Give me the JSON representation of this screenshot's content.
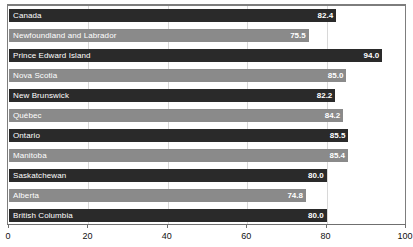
{
  "chart_data": {
    "type": "bar",
    "orientation": "horizontal",
    "title": "",
    "xlabel": "",
    "ylabel": "",
    "xlim": [
      0,
      100
    ],
    "grid": true,
    "legend": "none",
    "xticks": [
      "0",
      "20",
      "40",
      "60",
      "80",
      "100"
    ],
    "xtick_values": [
      0,
      20,
      40,
      60,
      80,
      100
    ],
    "categories": [
      "Canada",
      "Newfoundland and Labrador",
      "Prince Edward Island",
      "Nova Scotia",
      "New Brunswick",
      "Québec",
      "Ontario",
      "Manitoba",
      "Saskatchewan",
      "Alberta",
      "British Columbia"
    ],
    "values": [
      82.4,
      75.5,
      94.0,
      85.0,
      82.2,
      84.2,
      85.5,
      85.4,
      80.0,
      74.8,
      80.0
    ],
    "value_labels": [
      "82.4",
      "75.5",
      "94.0",
      "85.0",
      "82.2",
      "84.2",
      "85.5",
      "85.4",
      "80.0",
      "74.8",
      "80.0"
    ],
    "bar_colors": [
      "#2a2a2a",
      "#8a8a8a",
      "#2a2a2a",
      "#8a8a8a",
      "#2a2a2a",
      "#8a8a8a",
      "#2a2a2a",
      "#8a8a8a",
      "#2a2a2a",
      "#8a8a8a",
      "#2a2a2a"
    ],
    "label_color": "#ffffff",
    "frame_color": "#7d7d7d",
    "gridline_color": "#d8d8d8"
  }
}
